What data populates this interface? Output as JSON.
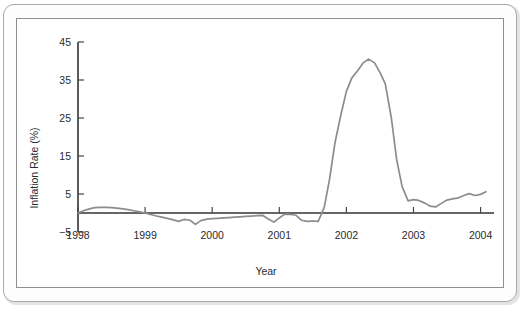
{
  "chart_data": {
    "type": "line",
    "title": "",
    "xlabel": "Year",
    "ylabel": "Inflation Rate (%)",
    "xlim": [
      1998,
      2004.2
    ],
    "ylim": [
      -5,
      45
    ],
    "grid": false,
    "legend": null,
    "xticks": [
      1998,
      1999,
      2000,
      2001,
      2002,
      2003,
      2004
    ],
    "xtick_labels": [
      "1998",
      "1999",
      "2000",
      "2001",
      "2002",
      "2003",
      "2004"
    ],
    "yticks": [
      -5,
      5,
      15,
      25,
      35,
      45
    ],
    "ytick_labels": [
      "-5",
      "5",
      "15",
      "25",
      "35",
      "45"
    ],
    "line_color": "#8c8c8c",
    "axis_color": "#333333",
    "series": [
      {
        "name": "Inflation Rate",
        "x": [
          1998.0,
          1998.08,
          1998.17,
          1998.25,
          1998.33,
          1998.42,
          1998.5,
          1998.58,
          1998.67,
          1998.75,
          1998.83,
          1998.92,
          1999.0,
          1999.08,
          1999.17,
          1999.25,
          1999.33,
          1999.42,
          1999.5,
          1999.58,
          1999.67,
          1999.75,
          1999.83,
          1999.92,
          2000.0,
          2000.08,
          2000.17,
          2000.25,
          2000.33,
          2000.42,
          2000.5,
          2000.58,
          2000.67,
          2000.75,
          2000.83,
          2000.92,
          2001.0,
          2001.08,
          2001.17,
          2001.25,
          2001.33,
          2001.42,
          2001.5,
          2001.58,
          2001.67,
          2001.75,
          2001.83,
          2001.92,
          2002.0,
          2002.08,
          2002.17,
          2002.25,
          2002.33,
          2002.42,
          2002.5,
          2002.58,
          2002.67,
          2002.75,
          2002.83,
          2002.92,
          2003.0,
          2003.08,
          2003.17,
          2003.25,
          2003.33,
          2003.42,
          2003.5,
          2003.58,
          2003.67,
          2003.75,
          2003.83,
          2003.92,
          2004.0,
          2004.08
        ],
        "y": [
          0.0,
          0.6,
          1.1,
          1.4,
          1.5,
          1.5,
          1.4,
          1.3,
          1.1,
          0.9,
          0.6,
          0.3,
          0.0,
          -0.4,
          -0.8,
          -1.1,
          -1.4,
          -1.8,
          -2.2,
          -1.7,
          -1.9,
          -3.0,
          -2.0,
          -1.6,
          -1.5,
          -1.4,
          -1.3,
          -1.2,
          -1.1,
          -1.0,
          -0.9,
          -0.8,
          -0.7,
          -0.6,
          -1.5,
          -2.4,
          -1.3,
          -0.3,
          -0.4,
          -0.6,
          -1.9,
          -2.2,
          -2.1,
          -2.2,
          1.5,
          9.0,
          18.5,
          26.0,
          32.0,
          35.5,
          37.5,
          39.5,
          40.5,
          39.5,
          37.0,
          34.0,
          25.0,
          14.0,
          7.0,
          3.2,
          3.5,
          3.3,
          2.6,
          1.8,
          1.6,
          2.6,
          3.4,
          3.7,
          4.0,
          4.6,
          5.1,
          4.6,
          4.9,
          5.6
        ]
      }
    ],
    "annotations": {
      "peak_value": 40.5,
      "peak_year": "2002.33",
      "description": "Inflation rate spike peaking near 40% in mid-2002"
    }
  },
  "axis": {
    "ylabel_text": "Inflation Rate (%)",
    "xlabel_text": "Year"
  }
}
